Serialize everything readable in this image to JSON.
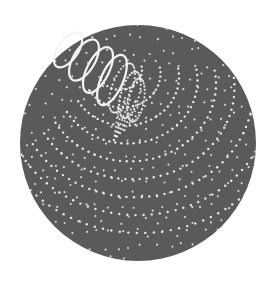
{
  "figure": {
    "width": 276,
    "height": 289,
    "background": "#ffffff",
    "disc": {
      "cx": 138,
      "cy": 143,
      "r": 118,
      "fill": "#5a5a5a"
    },
    "dot_color": "#e8e8e8",
    "coil_color": "#f4f4f4",
    "funnel_tip": {
      "x": 114,
      "y": 140
    },
    "coils": [
      {
        "cx": 68,
        "cy": 50,
        "rx": 10,
        "ry": 20,
        "rot": 35
      },
      {
        "cx": 84,
        "cy": 60,
        "rx": 11,
        "ry": 23,
        "rot": 30
      },
      {
        "cx": 98,
        "cy": 70,
        "rx": 11,
        "ry": 25,
        "rot": 27
      },
      {
        "cx": 112,
        "cy": 80,
        "rx": 11,
        "ry": 27,
        "rot": 24
      }
    ],
    "dotted_coils": [
      {
        "cx": 122,
        "cy": 88,
        "rx": 10,
        "ry": 26,
        "rot": 20
      },
      {
        "cx": 130,
        "cy": 95,
        "rx": 9,
        "ry": 24,
        "rot": 15
      },
      {
        "cx": 136,
        "cy": 100,
        "rx": 8,
        "ry": 22,
        "rot": 10
      }
    ],
    "arcs": [
      {
        "r": 22,
        "spacing": 4.5
      },
      {
        "r": 38,
        "spacing": 5
      },
      {
        "r": 54,
        "spacing": 5.5
      },
      {
        "r": 70,
        "spacing": 6
      },
      {
        "r": 86,
        "spacing": 6.5
      },
      {
        "r": 102,
        "spacing": 7
      },
      {
        "r": 118,
        "spacing": 7.5
      },
      {
        "r": 134,
        "spacing": 8
      },
      {
        "r": 150,
        "spacing": 8.5
      }
    ],
    "arc_center": {
      "x": 120,
      "y": 70
    },
    "arc_start_deg": -10,
    "arc_end_deg": 150,
    "scatter_count": 220,
    "scatter_seed": 7
  }
}
